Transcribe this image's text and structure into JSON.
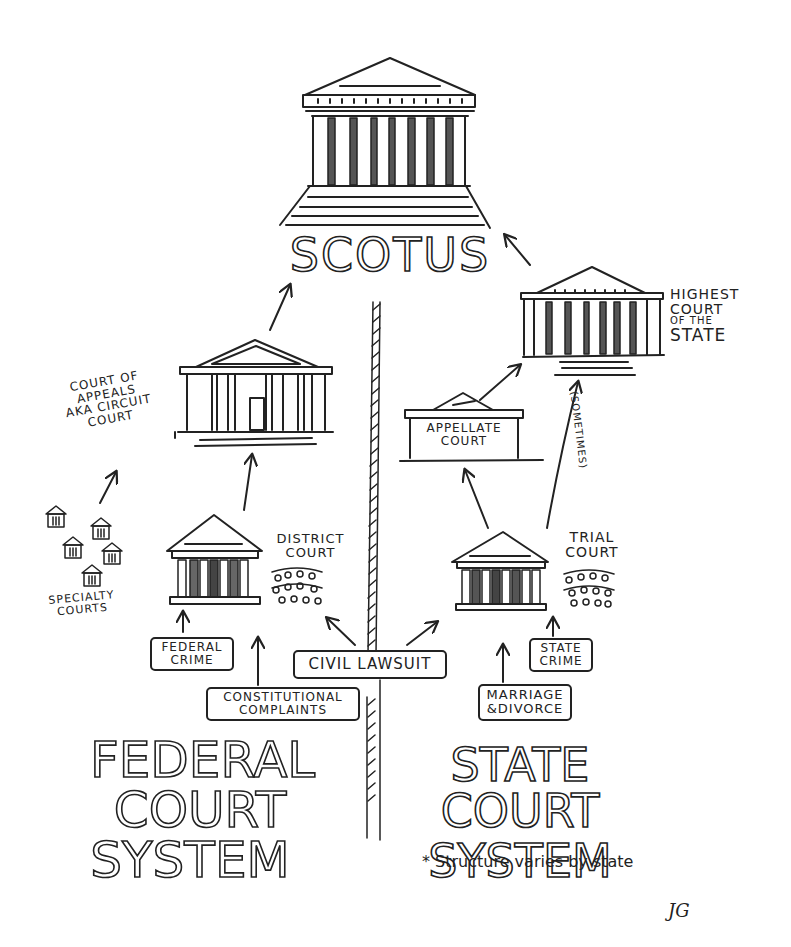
{
  "diagram": {
    "type": "hand-drawn flowchart",
    "supreme_court": {
      "label": "SCOTUS"
    },
    "federal_system": {
      "title_lines": [
        "FEDERAL",
        "COURT",
        "SYSTEM"
      ],
      "court_of_appeals": {
        "label_lines": [
          "COURT OF",
          "APPEALS",
          "AKA CIRCUIT",
          "COURT"
        ]
      },
      "district_court": {
        "label_lines": [
          "DISTRICT",
          "COURT"
        ]
      },
      "specialty_courts": {
        "label_lines": [
          "SPECIALTY",
          "COURTS"
        ],
        "count": 5
      },
      "inputs": {
        "federal_crime": [
          "FEDERAL",
          "CRIME"
        ],
        "constitutional_complaints": [
          "CONSTITUTIONAL",
          "COMPLAINTS"
        ]
      }
    },
    "shared_input": {
      "civil_lawsuit": "CIVIL LAWSUIT"
    },
    "state_system": {
      "title_lines": [
        "STATE COURT",
        "SYSTEM"
      ],
      "highest_court": {
        "label_lines": [
          "HIGHEST",
          "COURT",
          "OF THE",
          "STATE"
        ]
      },
      "appellate_court": {
        "label_lines": [
          "APPELLATE",
          "COURT"
        ]
      },
      "trial_court": {
        "label_lines": [
          "TRIAL",
          "COURT"
        ]
      },
      "sometimes_label": "(SOMETIMES)",
      "inputs": {
        "state_crime": [
          "STATE",
          "CRIME"
        ],
        "marriage_divorce": [
          "MARRIAGE",
          "&DIVORCE"
        ]
      },
      "footnote": "* Structure varies by state"
    },
    "signature": "JG",
    "colors": {
      "ink": "#222222",
      "paper": "#ffffff"
    }
  }
}
